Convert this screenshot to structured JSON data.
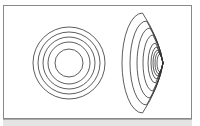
{
  "diagram": {
    "line_color": "#333333",
    "left_figure": {
      "type": "concentric-circles",
      "center": [
        69,
        63
      ],
      "radii": [
        36,
        31,
        26,
        21,
        14
      ]
    },
    "right_figure": {
      "type": "nested-ellipses",
      "apex_x": 163,
      "center_y": 63,
      "ellipses": [
        {
          "left": 122,
          "ry": 50
        },
        {
          "left": 130,
          "ry": 42
        },
        {
          "left": 137,
          "ry": 35
        },
        {
          "left": 143,
          "ry": 28
        },
        {
          "left": 148,
          "ry": 20
        },
        {
          "left": 151,
          "ry": 16
        },
        {
          "left": 153,
          "ry": 13
        },
        {
          "left": 155,
          "ry": 11
        },
        {
          "left": 157,
          "ry": 9
        }
      ]
    }
  }
}
